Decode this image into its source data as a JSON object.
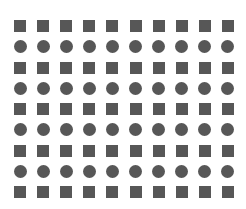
{
  "figure": {
    "background_color": "#ffffff",
    "shape_color": "#575757",
    "width": 246,
    "height": 209
  },
  "grid": {
    "columns": 10,
    "rows": 9,
    "column_pitch": 23.1,
    "row_pitch": 20.75,
    "origin_x": 14,
    "origin_y": 26,
    "square_size": 12,
    "circle_diameter": 13,
    "row_shapes": [
      "square",
      "circle",
      "square",
      "circle",
      "square",
      "circle",
      "square",
      "circle",
      "square"
    ],
    "row_labels": [
      "row-1-squares",
      "row-2-circles",
      "row-3-squares",
      "row-4-circles",
      "row-5-squares",
      "row-6-circles",
      "row-7-squares",
      "row-8-circles",
      "row-9-squares"
    ],
    "shape_counts": {
      "squares": 50,
      "circles": 40,
      "total": 90
    }
  }
}
